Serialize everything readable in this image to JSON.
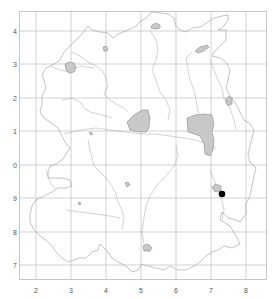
{
  "map": {
    "type": "distribution-grid-map",
    "background": "#ffffff",
    "frame_color": "#b8b8b8",
    "grid_color": "#bdbdbd",
    "area_fill": "#c8c8c8",
    "point_color": "#000000",
    "x_axis": {
      "ticks": [
        {
          "label": "2",
          "x": 36
        },
        {
          "label": "3",
          "x": 71
        },
        {
          "label": "4",
          "x": 106
        },
        {
          "label": "5",
          "x": 141
        },
        {
          "label": "6",
          "x": 176
        },
        {
          "label": "7",
          "x": 211
        },
        {
          "label": "8",
          "x": 246
        }
      ]
    },
    "y_axis": {
      "ticks": [
        {
          "label": "4",
          "y": 31
        },
        {
          "label": "3",
          "y": 64
        },
        {
          "label": "2",
          "y": 98
        },
        {
          "label": "1",
          "y": 131
        },
        {
          "label": "0",
          "y": 165
        },
        {
          "label": "9",
          "y": 198
        },
        {
          "label": "8",
          "y": 232
        },
        {
          "label": "7",
          "y": 265
        }
      ]
    },
    "shaded_areas": [
      {
        "name": "area-west-lake",
        "approx_grid": "3/3"
      },
      {
        "name": "area-north-small",
        "approx_grid": "4/3"
      },
      {
        "name": "area-north-east",
        "approx_grid": "5/4"
      },
      {
        "name": "area-east-lens",
        "approx_grid": "6/3"
      },
      {
        "name": "area-central",
        "approx_grid": "5/1"
      },
      {
        "name": "area-east-large",
        "approx_grid": "6/1"
      },
      {
        "name": "area-far-east-small",
        "approx_grid": "7/2"
      },
      {
        "name": "area-southeast-small",
        "approx_grid": "7/9"
      },
      {
        "name": "area-south-small",
        "approx_grid": "5/7"
      }
    ],
    "points": [
      {
        "name": "record-point",
        "approx_grid": "7/9"
      }
    ]
  }
}
